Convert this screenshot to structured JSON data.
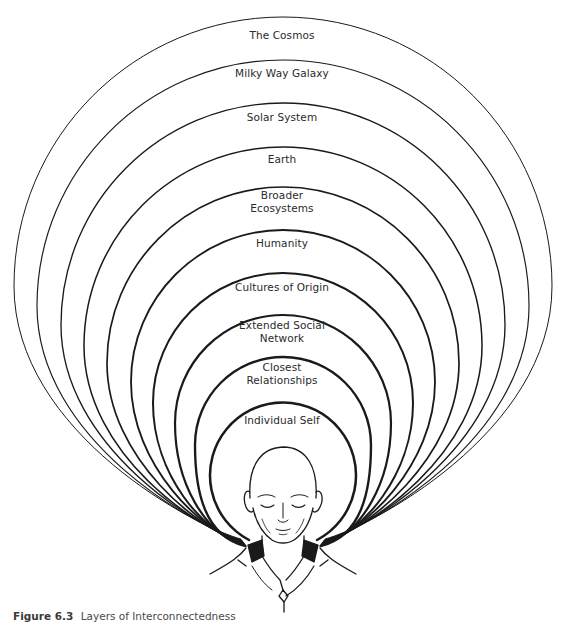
{
  "diagram": {
    "type": "concentric-layers",
    "layers": [
      {
        "label": "The Cosmos",
        "top": 17,
        "label_y": 35
      },
      {
        "label": "Milky Way Galaxy",
        "top": 60,
        "label_y": 73
      },
      {
        "label": "Solar System",
        "top": 103,
        "label_y": 117
      },
      {
        "label": "Earth",
        "top": 147,
        "label_y": 159
      },
      {
        "label": "Broader\nEcosystems",
        "top": 187,
        "label_y": 195
      },
      {
        "label": "Humanity",
        "top": 230,
        "label_y": 243
      },
      {
        "label": "Cultures of Origin",
        "top": 273,
        "label_y": 287
      },
      {
        "label": "Extended Social\nNetwork",
        "top": 315,
        "label_y": 325
      },
      {
        "label": "Closest\nRelationships",
        "top": 357,
        "label_y": 367
      },
      {
        "label": "Individual Self",
        "top": 400,
        "label_y": 420
      }
    ],
    "center_figure": "meditating-person",
    "stroke_color": "#1a1a1a"
  },
  "caption": {
    "figure_number": "Figure 6.3",
    "title": "Layers of Interconnectedness"
  }
}
